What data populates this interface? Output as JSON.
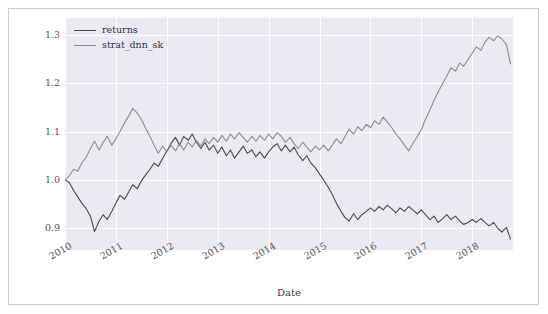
{
  "chart_data": {
    "type": "line",
    "title": "",
    "xlabel": "Date",
    "ylabel": "",
    "grid": true,
    "legend_position": "upper left",
    "xlim": [
      "2010-01-01",
      "2018-10-01"
    ],
    "ylim": [
      0.855,
      1.335
    ],
    "yticks": [
      "0.9",
      "1.0",
      "1.1",
      "1.2",
      "1.3"
    ],
    "ytick_values": [
      0.9,
      1.0,
      1.1,
      1.2,
      1.3
    ],
    "xticks": [
      "2010",
      "2011",
      "2012",
      "2013",
      "2014",
      "2015",
      "2016",
      "2017",
      "2018"
    ],
    "xtick_values": [
      2010,
      2011,
      2012,
      2013,
      2014,
      2015,
      2016,
      2017,
      2018
    ],
    "series": [
      {
        "name": "returns",
        "color": "#4a4a4a",
        "x": [
          2010.0,
          2010.08,
          2010.17,
          2010.25,
          2010.33,
          2010.42,
          2010.5,
          2010.58,
          2010.67,
          2010.75,
          2010.83,
          2010.92,
          2011.0,
          2011.08,
          2011.17,
          2011.25,
          2011.33,
          2011.42,
          2011.5,
          2011.58,
          2011.67,
          2011.75,
          2011.83,
          2011.92,
          2012.0,
          2012.08,
          2012.17,
          2012.25,
          2012.33,
          2012.42,
          2012.5,
          2012.58,
          2012.67,
          2012.75,
          2012.83,
          2012.92,
          2013.0,
          2013.08,
          2013.17,
          2013.25,
          2013.33,
          2013.42,
          2013.5,
          2013.58,
          2013.67,
          2013.75,
          2013.83,
          2013.92,
          2014.0,
          2014.08,
          2014.17,
          2014.25,
          2014.33,
          2014.42,
          2014.5,
          2014.58,
          2014.67,
          2014.75,
          2014.83,
          2014.92,
          2015.0,
          2015.08,
          2015.17,
          2015.25,
          2015.33,
          2015.42,
          2015.5,
          2015.58,
          2015.67,
          2015.75,
          2015.83,
          2015.92,
          2016.0,
          2016.08,
          2016.17,
          2016.25,
          2016.33,
          2016.42,
          2016.5,
          2016.58,
          2016.67,
          2016.75,
          2016.83,
          2016.92,
          2017.0,
          2017.08,
          2017.17,
          2017.25,
          2017.33,
          2017.42,
          2017.5,
          2017.58,
          2017.67,
          2017.75,
          2017.83,
          2017.92,
          2018.0,
          2018.08,
          2018.17,
          2018.25,
          2018.33,
          2018.42,
          2018.5,
          2018.58,
          2018.67,
          2018.75
        ],
        "values": [
          1.0,
          0.995,
          0.978,
          0.965,
          0.952,
          0.94,
          0.925,
          0.893,
          0.915,
          0.928,
          0.918,
          0.935,
          0.952,
          0.968,
          0.96,
          0.975,
          0.99,
          0.982,
          0.998,
          1.01,
          1.022,
          1.035,
          1.028,
          1.045,
          1.06,
          1.075,
          1.088,
          1.072,
          1.09,
          1.082,
          1.095,
          1.078,
          1.065,
          1.078,
          1.062,
          1.072,
          1.055,
          1.068,
          1.05,
          1.062,
          1.045,
          1.058,
          1.07,
          1.055,
          1.062,
          1.048,
          1.058,
          1.045,
          1.058,
          1.068,
          1.075,
          1.06,
          1.072,
          1.058,
          1.068,
          1.052,
          1.04,
          1.05,
          1.035,
          1.025,
          1.012,
          1.0,
          0.985,
          0.97,
          0.952,
          0.935,
          0.922,
          0.915,
          0.93,
          0.918,
          0.928,
          0.935,
          0.942,
          0.935,
          0.945,
          0.938,
          0.948,
          0.94,
          0.932,
          0.942,
          0.935,
          0.945,
          0.938,
          0.93,
          0.938,
          0.928,
          0.918,
          0.925,
          0.912,
          0.92,
          0.928,
          0.918,
          0.925,
          0.915,
          0.908,
          0.912,
          0.918,
          0.912,
          0.92,
          0.912,
          0.905,
          0.912,
          0.9,
          0.892,
          0.902,
          0.878
        ]
      },
      {
        "name": "strat_dnn_sk",
        "color": "#8c8c8c",
        "x": [
          2010.0,
          2010.08,
          2010.17,
          2010.25,
          2010.33,
          2010.42,
          2010.5,
          2010.58,
          2010.67,
          2010.75,
          2010.83,
          2010.92,
          2011.0,
          2011.08,
          2011.17,
          2011.25,
          2011.33,
          2011.42,
          2011.5,
          2011.58,
          2011.67,
          2011.75,
          2011.83,
          2011.92,
          2012.0,
          2012.08,
          2012.17,
          2012.25,
          2012.33,
          2012.42,
          2012.5,
          2012.58,
          2012.67,
          2012.75,
          2012.83,
          2012.92,
          2013.0,
          2013.08,
          2013.17,
          2013.25,
          2013.33,
          2013.42,
          2013.5,
          2013.58,
          2013.67,
          2013.75,
          2013.83,
          2013.92,
          2014.0,
          2014.08,
          2014.17,
          2014.25,
          2014.33,
          2014.42,
          2014.5,
          2014.58,
          2014.67,
          2014.75,
          2014.83,
          2014.92,
          2015.0,
          2015.08,
          2015.17,
          2015.25,
          2015.33,
          2015.42,
          2015.5,
          2015.58,
          2015.67,
          2015.75,
          2015.83,
          2015.92,
          2016.0,
          2016.08,
          2016.17,
          2016.25,
          2016.33,
          2016.42,
          2016.5,
          2016.58,
          2016.67,
          2016.75,
          2016.83,
          2016.92,
          2017.0,
          2017.08,
          2017.17,
          2017.25,
          2017.33,
          2017.42,
          2017.5,
          2017.58,
          2017.67,
          2017.75,
          2017.83,
          2017.92,
          2018.0,
          2018.08,
          2018.17,
          2018.25,
          2018.33,
          2018.42,
          2018.5,
          2018.58,
          2018.67,
          2018.75
        ],
        "values": [
          1.0,
          1.008,
          1.022,
          1.018,
          1.035,
          1.048,
          1.065,
          1.08,
          1.062,
          1.078,
          1.09,
          1.072,
          1.085,
          1.1,
          1.118,
          1.132,
          1.148,
          1.138,
          1.125,
          1.108,
          1.09,
          1.072,
          1.055,
          1.07,
          1.058,
          1.072,
          1.06,
          1.075,
          1.062,
          1.078,
          1.068,
          1.082,
          1.07,
          1.085,
          1.075,
          1.088,
          1.078,
          1.092,
          1.08,
          1.095,
          1.085,
          1.098,
          1.088,
          1.078,
          1.09,
          1.08,
          1.092,
          1.082,
          1.095,
          1.085,
          1.098,
          1.09,
          1.078,
          1.088,
          1.075,
          1.065,
          1.078,
          1.068,
          1.058,
          1.07,
          1.062,
          1.072,
          1.06,
          1.072,
          1.085,
          1.075,
          1.09,
          1.105,
          1.095,
          1.11,
          1.102,
          1.115,
          1.108,
          1.122,
          1.115,
          1.13,
          1.12,
          1.108,
          1.095,
          1.085,
          1.072,
          1.06,
          1.075,
          1.09,
          1.105,
          1.125,
          1.145,
          1.165,
          1.182,
          1.2,
          1.215,
          1.232,
          1.225,
          1.242,
          1.235,
          1.25,
          1.262,
          1.275,
          1.268,
          1.285,
          1.295,
          1.288,
          1.298,
          1.292,
          1.28,
          1.24
        ]
      }
    ]
  },
  "legend": {
    "items": [
      {
        "label": "returns",
        "color": "#4a4a4a"
      },
      {
        "label": "strat_dnn_sk",
        "color": "#8c8c8c"
      }
    ]
  }
}
